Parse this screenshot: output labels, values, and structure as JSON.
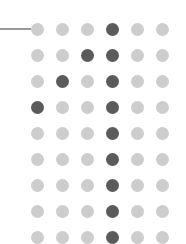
{
  "grid": {
    "rows": 9,
    "cols": 6,
    "col_x": [
      37,
      62,
      87,
      112,
      137,
      162
    ],
    "row_y": [
      29,
      55,
      81,
      107,
      133,
      159,
      185,
      211,
      237
    ],
    "dot_diameter": 13,
    "colors": {
      "light": "#cdcdcd",
      "dark": "#5b5b5b",
      "line": "#9a9a9a"
    },
    "dark_cells": [
      [
        0,
        3
      ],
      [
        1,
        2
      ],
      [
        1,
        3
      ],
      [
        2,
        1
      ],
      [
        2,
        3
      ],
      [
        3,
        0
      ],
      [
        3,
        3
      ],
      [
        4,
        3
      ],
      [
        5,
        3
      ],
      [
        6,
        3
      ],
      [
        7,
        3
      ],
      [
        8,
        3
      ]
    ]
  },
  "pointer_line": {
    "x1": 0,
    "x2": 31,
    "y": 29
  }
}
